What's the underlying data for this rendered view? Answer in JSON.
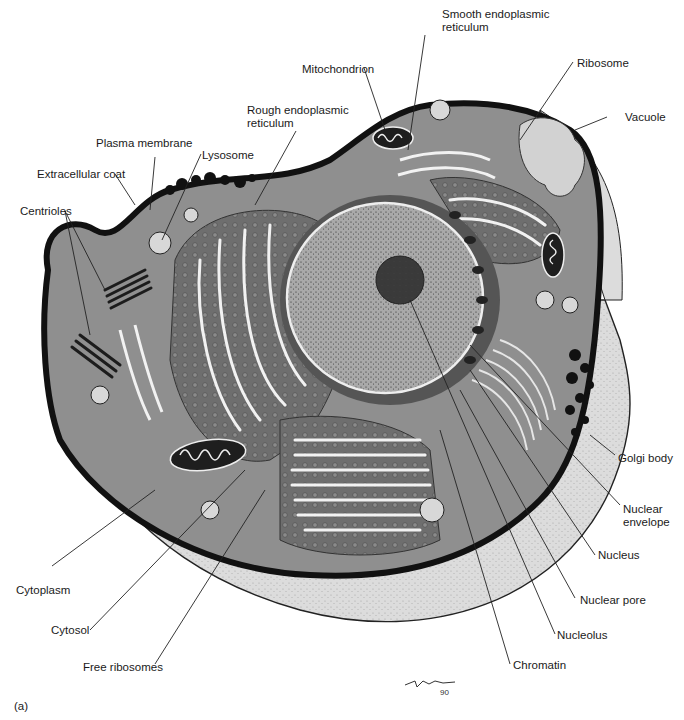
{
  "figure": {
    "panel_tag": "(a)",
    "signature": "Nemo 90"
  },
  "colors": {
    "background": "#ffffff",
    "cytoplasm": "#8f8f8f",
    "outer_coat": "#dcdcdc",
    "membrane": "#111111",
    "rough_er": "#6e6e6e",
    "nucleus": "#a9a9a9",
    "nucleolus": "#3a3a3a",
    "er_lumen": "#f2f2f2"
  },
  "labels": {
    "smooth_er": "Smooth endoplasmic\nreticulum",
    "mitochondrion": "Mitochondrion",
    "ribosome": "Ribosome",
    "rough_er": "Rough endoplasmic\nreticulum",
    "vacuole": "Vacuole",
    "plasma_membrane": "Plasma membrane",
    "lysosome": "Lysosome",
    "extracellular_coat": "Extracellular coat",
    "centrioles": "Centrioles",
    "golgi_body": "Golgi body",
    "nuclear_envelope": "Nuclear\nenvelope",
    "nucleus": "Nucleus",
    "cytoplasm": "Cytoplasm",
    "nuclear_pore": "Nuclear pore",
    "cytosol": "Cytosol",
    "nucleolus": "Nucleolus",
    "free_ribosomes": "Free ribosomes",
    "chromatin": "Chromatin"
  }
}
